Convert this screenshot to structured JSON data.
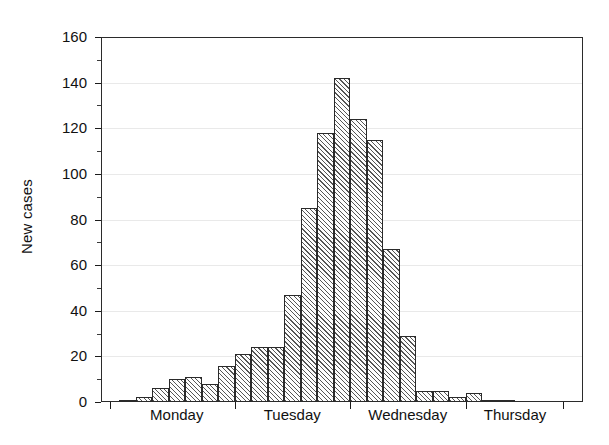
{
  "chart_data": {
    "type": "bar",
    "title": "",
    "subtitle": "",
    "xlabel": "",
    "ylabel": "New cases",
    "ylim": [
      0,
      160
    ],
    "ytick_labels": [
      "0",
      "20",
      "40",
      "60",
      "80",
      "100",
      "120",
      "140",
      "160"
    ],
    "ytick_values": [
      0,
      20,
      40,
      60,
      80,
      100,
      120,
      140,
      160
    ],
    "grid": true,
    "legend": "none",
    "bar_style": {
      "fill": "diagonal-hatch",
      "edge_color": "#2a2a2a",
      "face_color": "#ffffff",
      "hatch_color": "#555555"
    },
    "group_labels": [
      "Monday",
      "Tuesday",
      "Wednesday",
      "Thursday"
    ],
    "group_boundaries": [
      0,
      7,
      14,
      21,
      27
    ],
    "categories": [
      "Mon 1",
      "Mon 2",
      "Mon 3",
      "Mon 4",
      "Mon 5",
      "Mon 6",
      "Mon 7",
      "Tue 1",
      "Tue 2",
      "Tue 3",
      "Tue 4",
      "Tue 5",
      "Tue 6",
      "Tue 7",
      "Wed 1",
      "Wed 2",
      "Wed 3",
      "Wed 4",
      "Wed 5",
      "Wed 6",
      "Wed 7",
      "Thu 1",
      "Thu 2",
      "Thu 3",
      "Thu 4",
      "Thu 5",
      "Thu 6"
    ],
    "values": [
      1,
      2,
      6,
      10,
      11,
      8,
      16,
      21,
      24,
      24,
      47,
      85,
      118,
      142,
      124,
      115,
      67,
      29,
      5,
      5,
      2,
      4,
      1,
      1,
      0,
      0,
      0
    ]
  },
  "axis": {
    "y_title": "New cases"
  }
}
